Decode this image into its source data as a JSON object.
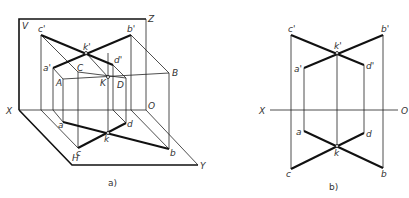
{
  "figure_a": {
    "caption": "a)",
    "planes": {
      "V": "V",
      "H": "H",
      "Z": "Z",
      "X": "X",
      "Y": "Y",
      "O": "O"
    },
    "points_3d": {
      "A": "A",
      "B": "B",
      "C": "C",
      "D": "D",
      "K": "K"
    },
    "front_projections": {
      "a": "a'",
      "b": "b'",
      "c": "c'",
      "d": "d'",
      "k": "k'"
    },
    "top_projections": {
      "a": "a",
      "b": "b",
      "c": "c",
      "d": "d",
      "k": "k"
    }
  },
  "figure_b": {
    "caption": "b)",
    "axis": {
      "X": "X",
      "O": "O"
    },
    "front_projections": {
      "a": "a'",
      "b": "b'",
      "c": "c'",
      "d": "d'",
      "k": "k'"
    },
    "top_projections": {
      "a": "a",
      "b": "b",
      "c": "c",
      "d": "d",
      "k": "k"
    }
  }
}
